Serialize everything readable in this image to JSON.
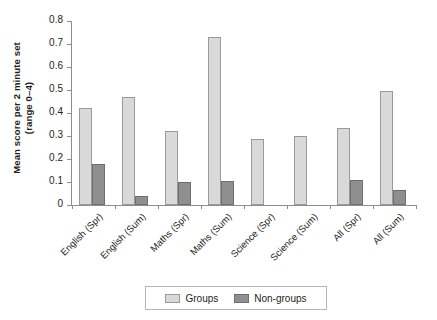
{
  "chart_data": {
    "type": "bar",
    "title": "",
    "xlabel": "",
    "ylabel": "Mean score per 2 minute set (range 0–4)",
    "ylabel_lines": [
      "Mean score per 2 minute set",
      "(range 0–4)"
    ],
    "categories": [
      "English (Spr)",
      "English (Sum)",
      "Maths (Spr)",
      "Maths (Sum)",
      "Science (Spr)",
      "Science (Sum)",
      "All (Spr)",
      "All (Sum)"
    ],
    "series": [
      {
        "name": "Groups",
        "color": "#d9d9d9",
        "values": [
          0.42,
          0.47,
          0.32,
          0.73,
          0.285,
          0.3,
          0.335,
          0.495
        ]
      },
      {
        "name": "Non-groups",
        "color": "#8f8f8f",
        "values": [
          0.18,
          0.04,
          0.1,
          0.105,
          0.0,
          0.0,
          0.11,
          0.065
        ]
      }
    ],
    "ylim": [
      0,
      0.8
    ],
    "ytick_values": [
      0,
      0.1,
      0.2,
      0.3,
      0.4,
      0.5,
      0.6,
      0.7,
      0.8
    ],
    "ytick_labels": [
      "0",
      "0.1",
      "0.2",
      "0.3",
      "0.4",
      "0.5",
      "0.6",
      "0.7",
      "0.8"
    ],
    "grid": false,
    "legend_position": "bottom",
    "legend_entries": [
      "Groups",
      "Non-groups"
    ]
  },
  "legend": {
    "groups_label": "Groups",
    "nongroups_label": "Non-groups"
  }
}
